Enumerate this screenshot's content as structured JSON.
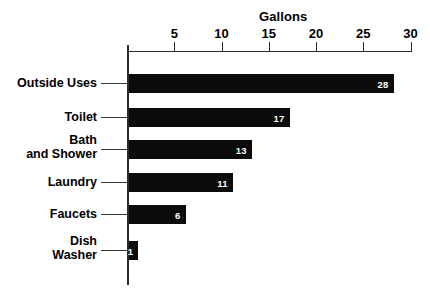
{
  "chart_data": {
    "type": "bar",
    "orientation": "horizontal",
    "title": "Gallons",
    "xlabel": "Gallons",
    "ylabel": "",
    "categories": [
      "Outside Uses",
      "Toilet",
      "Bath and Shower",
      "Laundry",
      "Faucets",
      "Dish Washer"
    ],
    "values": [
      28,
      17,
      13,
      11,
      6,
      1
    ],
    "xlim": [
      0,
      31
    ],
    "xticks": [
      5,
      10,
      15,
      20,
      25,
      30
    ],
    "xtick_labels": [
      "5",
      "10",
      "15",
      "20",
      "25",
      "30"
    ],
    "grid": false,
    "legend": false,
    "axis_position": "top",
    "bar_color": "#0b0b0b",
    "value_label_color": "#ffffff",
    "background_color": "#ffffff"
  },
  "axis": {
    "title": "Gallons",
    "ticks": [
      {
        "label": "5",
        "value": 5
      },
      {
        "label": "10",
        "value": 10
      },
      {
        "label": "15",
        "value": 15
      },
      {
        "label": "20",
        "value": 20
      },
      {
        "label": "25",
        "value": 25
      },
      {
        "label": "30",
        "value": 30
      }
    ]
  },
  "bars": [
    {
      "label_line1": "Outside Uses",
      "label_line2": "",
      "value": 28,
      "value_text": "28"
    },
    {
      "label_line1": "Toilet",
      "label_line2": "",
      "value": 17,
      "value_text": "17"
    },
    {
      "label_line1": "Bath",
      "label_line2": "and Shower",
      "value": 13,
      "value_text": "13"
    },
    {
      "label_line1": "Laundry",
      "label_line2": "",
      "value": 11,
      "value_text": "11"
    },
    {
      "label_line1": "Faucets",
      "label_line2": "",
      "value": 6,
      "value_text": "6"
    },
    {
      "label_line1": "Dish",
      "label_line2": "Washer",
      "value": 1,
      "value_text": "1"
    }
  ]
}
